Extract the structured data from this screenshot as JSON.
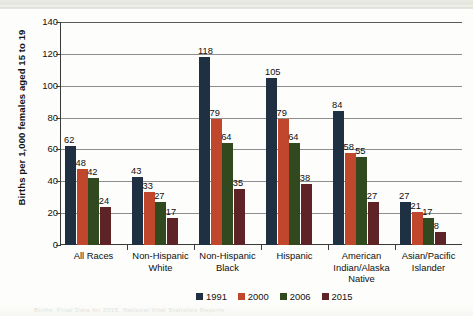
{
  "chart_data": {
    "type": "bar",
    "title": "",
    "xlabel": "",
    "ylabel": "Births per 1,000 females aged 15 to 19",
    "ylim": [
      0,
      140
    ],
    "yticks": [
      0,
      20,
      40,
      60,
      80,
      100,
      120,
      140
    ],
    "grid": true,
    "legend_position": "bottom",
    "categories": [
      "All Races",
      "Non-Hispanic White",
      "Non-Hispanic Black",
      "Hispanic",
      "American Indian/Alaska Native",
      "Asian/Pacific Islander"
    ],
    "category_lines": [
      [
        "All Races"
      ],
      [
        "Non-Hispanic",
        "White"
      ],
      [
        "Non-Hispanic",
        "Black"
      ],
      [
        "Hispanic"
      ],
      [
        "American",
        "Indian/Alaska",
        "Native"
      ],
      [
        "Asian/Pacific",
        "Islander"
      ]
    ],
    "series": [
      {
        "name": "1991",
        "color": "#1f3043",
        "values": [
          62,
          43,
          118,
          105,
          84,
          27
        ]
      },
      {
        "name": "2000",
        "color": "#c0472b",
        "values": [
          48,
          33,
          79,
          79,
          58,
          21
        ]
      },
      {
        "name": "2006",
        "color": "#31491f",
        "values": [
          42,
          27,
          64,
          64,
          55,
          17
        ]
      },
      {
        "name": "2015",
        "color": "#5e2327",
        "values": [
          24,
          17,
          35,
          38,
          27,
          8
        ]
      }
    ]
  },
  "caption": "Births: Final Data for 2015, National Vital Statistics Reports"
}
